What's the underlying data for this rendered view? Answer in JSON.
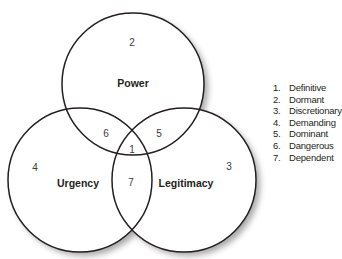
{
  "diagram": {
    "type": "venn",
    "circles": [
      {
        "key": "power",
        "label": "Power"
      },
      {
        "key": "urgency",
        "label": "Urgency"
      },
      {
        "key": "legitimacy",
        "label": "Legitimacy"
      }
    ],
    "regions": {
      "definitive": "1",
      "dormant": "2",
      "discretionary": "3",
      "demanding": "4",
      "dominant": "5",
      "dangerous": "6",
      "dependent": "7"
    },
    "line_color": "#231f20"
  },
  "legend": {
    "items": [
      {
        "num": "1.",
        "label": "Definitive"
      },
      {
        "num": "2.",
        "label": "Dormant"
      },
      {
        "num": "3.",
        "label": "Discretionary"
      },
      {
        "num": "4.",
        "label": "Demanding"
      },
      {
        "num": "5.",
        "label": "Dominant"
      },
      {
        "num": "6.",
        "label": "Dangerous"
      },
      {
        "num": "7.",
        "label": "Dependent"
      }
    ]
  }
}
